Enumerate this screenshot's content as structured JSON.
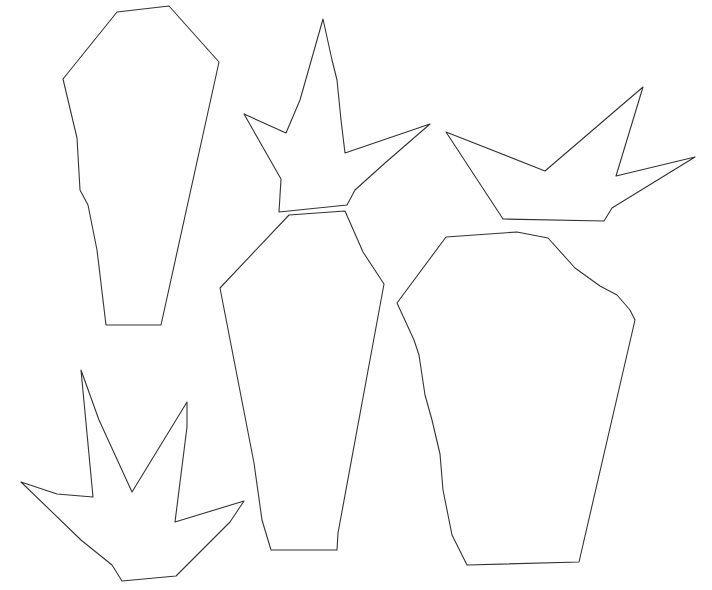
{
  "diagram": {
    "stroke_color": "#333333",
    "fill_color": "#ffffff",
    "background_color": "#ffffff",
    "shapes": [
      {
        "name": "shape-tall-body-left",
        "kind": "body"
      },
      {
        "name": "shape-spiky-top-middle",
        "kind": "spiky"
      },
      {
        "name": "shape-spiky-top-right",
        "kind": "spiky"
      },
      {
        "name": "shape-tall-body-middle",
        "kind": "body"
      },
      {
        "name": "shape-wide-body-right",
        "kind": "body"
      },
      {
        "name": "shape-spiky-bottom-left",
        "kind": "spiky"
      }
    ]
  }
}
